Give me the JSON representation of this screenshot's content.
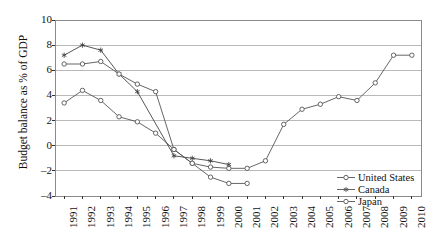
{
  "chart_data": {
    "type": "line",
    "title": "",
    "xlabel": "",
    "ylabel": "Budget balance as % of GDP",
    "ylim": [
      -4,
      10
    ],
    "yticks": [
      10,
      8,
      6,
      4,
      2,
      0,
      -2,
      -4
    ],
    "grid": "horizontal",
    "legend_position": "bottom-right",
    "categories": [
      "1991",
      "1992",
      "1993",
      "1994",
      "1995",
      "1996",
      "1997",
      "1998",
      "1999",
      "2000",
      "2001",
      "2002",
      "2003",
      "2004",
      "2005",
      "2006",
      "2007",
      "2008",
      "2009",
      "2010"
    ],
    "series": [
      {
        "name": "United States",
        "marker": "open-circle",
        "color": "#555555",
        "values": [
          3.4,
          4.4,
          3.6,
          2.3,
          1.9,
          1.0,
          -0.3,
          -1.4,
          -1.7,
          -1.8,
          -1.8,
          -1.2,
          1.7,
          2.9,
          3.3,
          3.9,
          3.6,
          5.0,
          7.2,
          7.2
        ]
      },
      {
        "name": "Canada",
        "marker": "star",
        "color": "#444444",
        "values": [
          7.2,
          8.0,
          7.6,
          5.7,
          4.3,
          null,
          -0.8,
          -1.0,
          -1.2,
          -1.5,
          null,
          null,
          null,
          null,
          null,
          null,
          null,
          null,
          null,
          null
        ]
      },
      {
        "name": "Japan",
        "marker": "open-circle",
        "color": "#555555",
        "values": [
          6.5,
          6.5,
          6.7,
          5.7,
          4.9,
          4.3,
          -0.3,
          -1.4,
          -2.5,
          -3.0,
          -3.0,
          null,
          null,
          null,
          null,
          null,
          null,
          null,
          null,
          null
        ]
      }
    ],
    "legend": [
      {
        "label": "United States",
        "marker": "open-circle"
      },
      {
        "label": "Canada",
        "marker": "star"
      },
      {
        "label": "Japan",
        "marker": "open-circle"
      }
    ]
  },
  "colors": {
    "grid": "#b9b9b9",
    "frame": "#8a8a8a",
    "line": "#555555",
    "text": "#111111",
    "background": "#ffffff"
  }
}
